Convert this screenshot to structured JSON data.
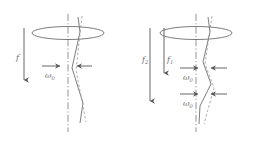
{
  "figure": {
    "background_color": "#ffffff",
    "line_color": "#6e6e6e",
    "dash_color": "#9a9a9a",
    "axis_color": "#7a7a7a",
    "arrow_color": "#555555",
    "label_color": "#6b6b6b",
    "width": 261,
    "height": 144
  },
  "panels": [
    {
      "id": "left-panel",
      "name": "single-force-panel",
      "axis": {
        "name": "vertical-centerline",
        "style": "dash-dot",
        "x": 68,
        "y_top": 14,
        "y_bottom": 132
      },
      "ellipse": {
        "name": "rotating-ring",
        "cx": 68,
        "cy": 33,
        "rx": 36,
        "ry": 6.5
      },
      "force_arrows": [
        {
          "name": "force-arrow-f",
          "label": "f",
          "subscript": "",
          "x": 24,
          "y_start": 28,
          "y_end": 80,
          "label_x": 16,
          "label_y": 60
        }
      ],
      "omega_rows": [
        {
          "name": "omega-row-1",
          "label": "ω",
          "subscript": "0",
          "label_x": 45,
          "label_y": 78,
          "left_arrow": {
            "name": "omega-arrow-right",
            "x_start": 42,
            "x_end": 60,
            "y": 66,
            "direction": "right"
          },
          "right_arrow": {
            "name": "omega-arrow-left",
            "x_start": 92,
            "x_end": 77,
            "y": 66,
            "direction": "left"
          }
        }
      ],
      "solid_curve": {
        "name": "deflected-shaft-solid",
        "points": "78,17 80,32 72,68 83,103 80,123"
      },
      "dashed_curve": {
        "name": "undeflected-shaft-dashed",
        "points": "82,16 76,70 86,122"
      }
    },
    {
      "id": "right-panel",
      "name": "double-force-panel",
      "axis": {
        "name": "vertical-centerline",
        "style": "dash-dot",
        "x": 196,
        "y_top": 14,
        "y_bottom": 132
      },
      "ellipse": {
        "name": "rotating-ring",
        "cx": 196,
        "cy": 33,
        "rx": 36,
        "ry": 6.5
      },
      "force_arrows": [
        {
          "name": "force-arrow-f2",
          "label": "f",
          "subscript": "2",
          "x": 150,
          "y_start": 28,
          "y_end": 101,
          "label_x": 142,
          "label_y": 62
        },
        {
          "name": "force-arrow-f1",
          "label": "f",
          "subscript": "1",
          "x": 164,
          "y_start": 28,
          "y_end": 73,
          "label_x": 167,
          "label_y": 62
        }
      ],
      "omega_rows": [
        {
          "name": "omega-row-1",
          "label": "ω",
          "subscript": "0",
          "label_x": 183,
          "label_y": 80,
          "left_arrow": {
            "name": "omega-arrow-right",
            "x_start": 180,
            "x_end": 198,
            "y": 68,
            "direction": "right"
          },
          "right_arrow": {
            "name": "omega-arrow-left",
            "x_start": 227,
            "x_end": 211,
            "y": 68,
            "direction": "left"
          }
        },
        {
          "name": "omega-row-2",
          "label": "ω",
          "subscript": "0",
          "label_x": 183,
          "label_y": 106,
          "left_arrow": {
            "name": "omega-arrow-right",
            "x_start": 180,
            "x_end": 198,
            "y": 94,
            "direction": "right"
          },
          "right_arrow": {
            "name": "omega-arrow-left",
            "x_start": 227,
            "x_end": 211,
            "y": 94,
            "direction": "left"
          }
        }
      ],
      "solid_curve": {
        "name": "deflected-shaft-solid",
        "points": "208,17 210,32 203,62 211,84 200,106 199,124"
      },
      "dashed_curve": {
        "name": "undeflected-shaft-dashed",
        "points": "212,16 205,64 214,88 204,124"
      }
    }
  ]
}
